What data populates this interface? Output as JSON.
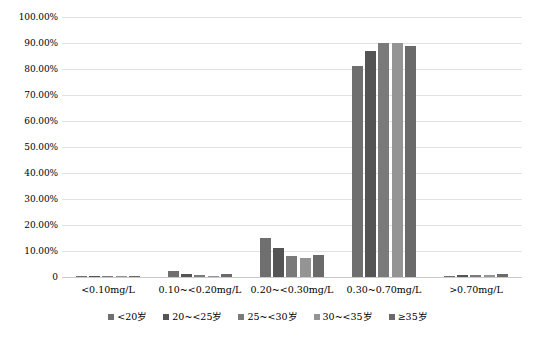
{
  "chart_data": {
    "type": "bar",
    "title": "",
    "xlabel": "",
    "ylabel": "",
    "ylim": [
      0,
      100
    ],
    "grid": true,
    "legend_position": "bottom",
    "y_ticks": [
      "100.00%",
      "90.00%",
      "80.00%",
      "70.00%",
      "60.00%",
      "50.00%",
      "40.00%",
      "30.00%",
      "20.00%",
      "10.00%",
      "0"
    ],
    "y_tick_values": [
      100,
      90,
      80,
      70,
      60,
      50,
      40,
      30,
      20,
      10,
      0
    ],
    "categories": [
      "<0.10mg/L",
      "0.10~<0.20mg/L",
      "0.20~<0.30mg/L",
      "0.30~0.70mg/L",
      ">0.70mg/L"
    ],
    "series": [
      {
        "name": "<20岁",
        "color": "#6f6f6f",
        "values": [
          0.1,
          2.5,
          15.0,
          81.0,
          0.5
        ]
      },
      {
        "name": "20~<25岁",
        "color": "#545454",
        "values": [
          0.1,
          1.0,
          11.0,
          87.0,
          0.9
        ]
      },
      {
        "name": "25~<30岁",
        "color": "#7a7a7a",
        "values": [
          0.1,
          0.6,
          8.0,
          90.0,
          0.7
        ]
      },
      {
        "name": "30~<35岁",
        "color": "#949494",
        "values": [
          0.1,
          0.5,
          7.5,
          90.0,
          0.6
        ]
      },
      {
        "name": "≥35岁",
        "color": "#6a6a6a",
        "values": [
          0.2,
          1.2,
          8.5,
          89.0,
          1.3
        ]
      }
    ]
  }
}
